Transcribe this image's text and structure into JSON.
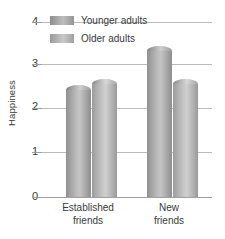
{
  "chart_data": {
    "type": "bar",
    "title": "",
    "xlabel": "",
    "ylabel": "Happiness",
    "ylim": [
      0,
      4
    ],
    "yticks": [
      0,
      1,
      2,
      3,
      4
    ],
    "ytick_labels": [
      "0",
      "1",
      "2",
      "3",
      "4"
    ],
    "grid": true,
    "legend_position": "top-left-inside",
    "categories": [
      "Established friends",
      "New friends"
    ],
    "category_lines": [
      [
        "Established",
        "friends"
      ],
      [
        "New",
        "friends"
      ]
    ],
    "series": [
      {
        "name": "Younger adults",
        "values": [
          2.55,
          3.45
        ],
        "color": "#a8a8a8"
      },
      {
        "name": "Older adults",
        "values": [
          2.7,
          2.7
        ],
        "color": "#c2c2c2"
      }
    ],
    "colors": {
      "gridline": "#b9bcbe",
      "axis": "#9b9fa1",
      "text": "#3a3a3a",
      "background": "#ffffff"
    }
  },
  "legend": {
    "items": [
      {
        "label": "Younger adults"
      },
      {
        "label": "Older adults"
      }
    ]
  },
  "axes": {
    "y_title": "Happiness",
    "y_ticks": [
      {
        "label": "4"
      },
      {
        "label": "3"
      },
      {
        "label": "2"
      },
      {
        "label": "1"
      },
      {
        "label": "0"
      }
    ],
    "x_categories": [
      {
        "line1": "Established",
        "line2": "friends"
      },
      {
        "line1": "New",
        "line2": "friends"
      }
    ]
  }
}
